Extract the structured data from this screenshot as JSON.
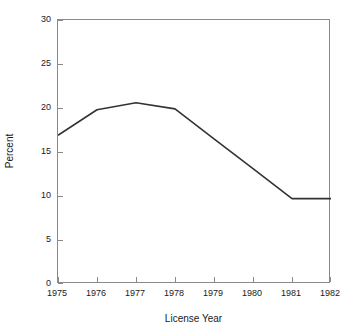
{
  "chart_data": {
    "type": "line",
    "title": "",
    "xlabel": "License Year",
    "ylabel": "Percent",
    "x": [
      1975,
      1976,
      1977,
      1978,
      1979,
      1980,
      1981,
      1982
    ],
    "categories": [
      "1975",
      "1976",
      "1977",
      "1978",
      "1979",
      "1980",
      "1981",
      "1982"
    ],
    "values": [
      16.9,
      19.8,
      20.6,
      19.9,
      16.5,
      13.1,
      9.7,
      9.7
    ],
    "series": [
      {
        "name": "Percent",
        "values": [
          16.9,
          19.8,
          20.6,
          19.9,
          16.5,
          13.1,
          9.7,
          9.7
        ],
        "color": "#333333"
      }
    ],
    "xlim": [
      1975,
      1982
    ],
    "ylim": [
      0,
      30
    ],
    "yticks": [
      0,
      5,
      10,
      15,
      20,
      25,
      30
    ],
    "ytick_labels": [
      "0",
      "5",
      "10",
      "15",
      "20",
      "25",
      "30"
    ],
    "xticks": [
      1975,
      1976,
      1977,
      1978,
      1979,
      1980,
      1981,
      1982
    ],
    "xtick_labels": [
      "1975",
      "1976",
      "1977",
      "1978",
      "1979",
      "1980",
      "1981",
      "1982"
    ],
    "grid": false,
    "legend": false,
    "legend_position": "none",
    "frame_color": "#8a8a8a",
    "line_color": "#333333",
    "background": "#ffffff"
  }
}
